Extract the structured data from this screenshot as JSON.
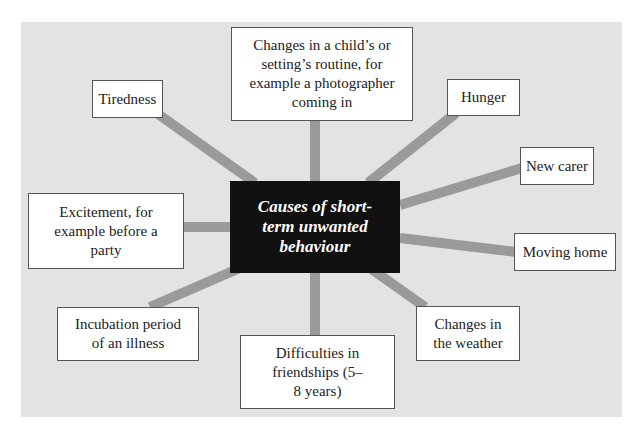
{
  "diagram": {
    "type": "spider-diagram",
    "center": {
      "label": "Causes of short-term unwanted behaviour"
    },
    "nodes": [
      {
        "id": "routine",
        "label": "Changes in a child’s or setting’s routine, for example a photographer coming in"
      },
      {
        "id": "tiredness",
        "label": "Tiredness"
      },
      {
        "id": "hunger",
        "label": "Hunger"
      },
      {
        "id": "new-carer",
        "label": "New carer"
      },
      {
        "id": "excitement",
        "label": "Excitement, for example before a party"
      },
      {
        "id": "moving-home",
        "label": "Moving home"
      },
      {
        "id": "incubation",
        "label": "Incubation period of an illness"
      },
      {
        "id": "weather",
        "label": "Changes in the weather"
      },
      {
        "id": "friendships",
        "label": "Difficulties in friendships (5–8 years)"
      }
    ]
  },
  "colors": {
    "background": "#e3e3e3",
    "connector": "#9a9a9a",
    "center_fill": "#111111",
    "center_text": "#ffffff",
    "box_border": "#555555"
  }
}
